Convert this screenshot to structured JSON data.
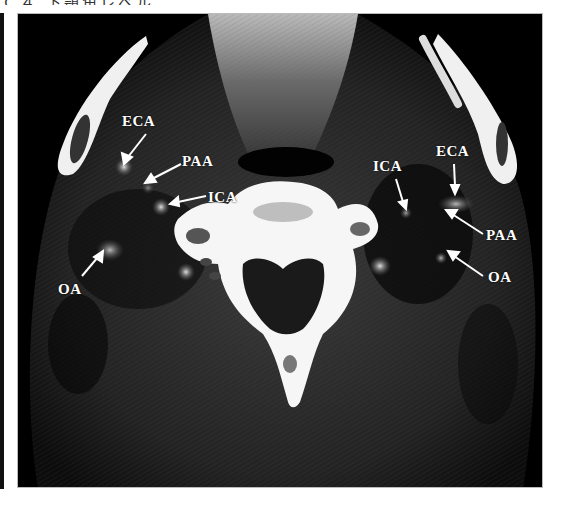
{
  "header": {
    "partial_caption": "Ｃ４ 下顎角レベル"
  },
  "figure": {
    "type": "axial CT image, neck at level of mandibular angle",
    "labels": [
      {
        "id": "left-eca",
        "text": "ECA",
        "side": "left"
      },
      {
        "id": "left-paa",
        "text": "PAA",
        "side": "left"
      },
      {
        "id": "left-ica",
        "text": "ICA",
        "side": "left"
      },
      {
        "id": "left-oa",
        "text": "OA",
        "side": "left"
      },
      {
        "id": "right-ica",
        "text": "ICA",
        "side": "right"
      },
      {
        "id": "right-eca",
        "text": "ECA",
        "side": "right"
      },
      {
        "id": "right-paa",
        "text": "PAA",
        "side": "right"
      },
      {
        "id": "right-oa",
        "text": "OA",
        "side": "right"
      }
    ]
  },
  "colors": {
    "background": "#ffffff",
    "ct_background": "#000000",
    "bone": "#f4f4f4",
    "label_text": "#ffffff"
  }
}
